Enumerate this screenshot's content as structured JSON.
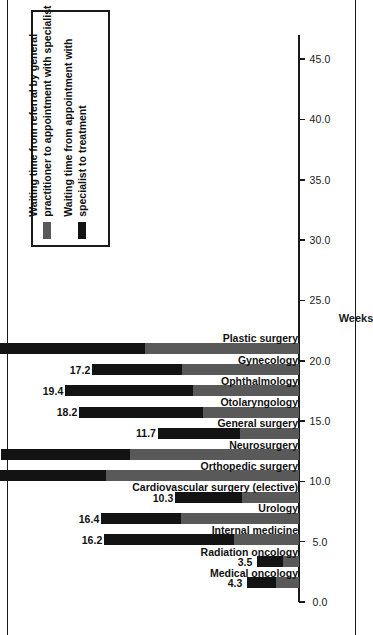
{
  "chart_data": {
    "type": "bar",
    "orientation": "vertical-rotated",
    "title": "",
    "xlabel": "",
    "ylabel": "Weeks",
    "ylim": [
      0.0,
      47.0
    ],
    "grid": false,
    "legend_position": "top-left",
    "tick_labels": [
      "0.0",
      "5.0",
      "10.0",
      "15.0",
      "20.0",
      "25.0",
      "30.0",
      "35.0",
      "40.0",
      "45.0"
    ],
    "tick_values": [
      0,
      5,
      10,
      15,
      20,
      25,
      30,
      35,
      40,
      45
    ],
    "categories": [
      "Medical oncology",
      "Radiation oncology",
      "Internal medicine",
      "Urology",
      "Cardiovascular surgery (elective)",
      "Orthopedic surgery",
      "Neurosurgery",
      "General surgery",
      "Otolaryngology",
      "Ophthalmology",
      "Gynecology",
      "Plastic surgery"
    ],
    "series": [
      {
        "name": "Waiting time from referral by general practitioner to appointment with specialist",
        "color": "#595959",
        "values": [
          1.9,
          1.3,
          5.4,
          9.8,
          4.7,
          16.0,
          14.0,
          4.9,
          8.0,
          8.8,
          9.7,
          12.8
        ]
      },
      {
        "name": "Waiting time from appointment with specialist to treatment",
        "color": "#131313",
        "values": [
          2.4,
          2.2,
          10.8,
          6.6,
          5.6,
          23.6,
          10.7,
          6.8,
          10.2,
          10.6,
          7.5,
          14.7
        ]
      }
    ],
    "totals": [
      4.3,
      3.5,
      16.2,
      16.4,
      10.3,
      39.6,
      24.7,
      11.7,
      18.2,
      19.4,
      17.2,
      27.5
    ],
    "data_labels": [
      "4.3",
      "3.5",
      "16.2",
      "16.4",
      "10.3",
      "39.6",
      "24.7",
      "11.7",
      "18.2",
      "19.4",
      "17.2",
      "27.5"
    ]
  },
  "legend": {
    "items": [
      {
        "label": "Waiting time from referral by general practitioner to appointment with specialist",
        "color": "#595959",
        "swatch_name": "legend-swatch-referral-to-specialist"
      },
      {
        "label": "Waiting time from appointment with specialist to treatment",
        "color": "#131313",
        "swatch_name": "legend-swatch-specialist-to-treatment"
      }
    ]
  },
  "axis": {
    "value_axis_title": "Weeks"
  },
  "colors": {
    "series_gray": "#595959",
    "series_black": "#131313",
    "axis": "#1a1a1a",
    "background": "#ffffff"
  }
}
